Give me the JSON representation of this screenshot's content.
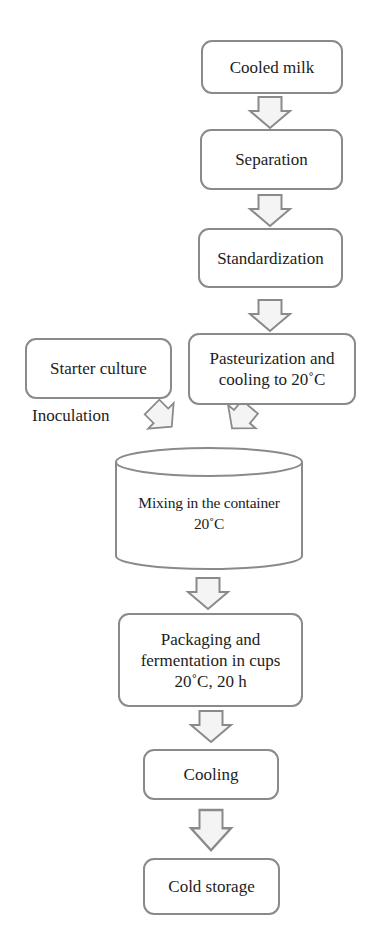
{
  "diagram": {
    "type": "process-flowchart",
    "colors": {
      "border": "#8a8a8a",
      "arrow_fill": "#f4f4f4",
      "text": "#1c1c1c",
      "background": "#ffffff"
    },
    "nodes": [
      {
        "id": "cooled_milk",
        "label": "Cooled milk",
        "shape": "rounded-rect"
      },
      {
        "id": "separation",
        "label": "Separation",
        "shape": "rounded-rect"
      },
      {
        "id": "standardization",
        "label": "Standardization",
        "shape": "rounded-rect"
      },
      {
        "id": "starter_culture",
        "label": "Starter culture",
        "shape": "rounded-rect"
      },
      {
        "id": "pasteurization",
        "label_lines": [
          "Pasteurization and",
          "cooling to 20˚C"
        ],
        "shape": "rounded-rect"
      },
      {
        "id": "mixing",
        "label_lines": [
          "Mixing in the container",
          "20˚C"
        ],
        "shape": "cylinder"
      },
      {
        "id": "packaging",
        "label_lines": [
          "Packaging and",
          "fermentation in cups",
          "20˚C, 20 h"
        ],
        "shape": "rounded-rect"
      },
      {
        "id": "cooling",
        "label": "Cooling",
        "shape": "rounded-rect"
      },
      {
        "id": "cold_storage",
        "label": "Cold storage",
        "shape": "rounded-rect"
      }
    ],
    "edge_labels": {
      "inoculation": "Inoculation"
    },
    "edges": [
      {
        "from": "cooled_milk",
        "to": "separation",
        "style": "block-arrow-down"
      },
      {
        "from": "separation",
        "to": "standardization",
        "style": "block-arrow-down"
      },
      {
        "from": "standardization",
        "to": "pasteurization",
        "style": "block-arrow-down"
      },
      {
        "from": "starter_culture",
        "to": "mixing",
        "style": "block-arrow-diagonal",
        "label": "Inoculation"
      },
      {
        "from": "pasteurization",
        "to": "mixing",
        "style": "block-arrow-diagonal"
      },
      {
        "from": "mixing",
        "to": "packaging",
        "style": "block-arrow-down"
      },
      {
        "from": "packaging",
        "to": "cooling",
        "style": "block-arrow-down"
      },
      {
        "from": "cooling",
        "to": "cold_storage",
        "style": "block-arrow-down"
      }
    ]
  }
}
